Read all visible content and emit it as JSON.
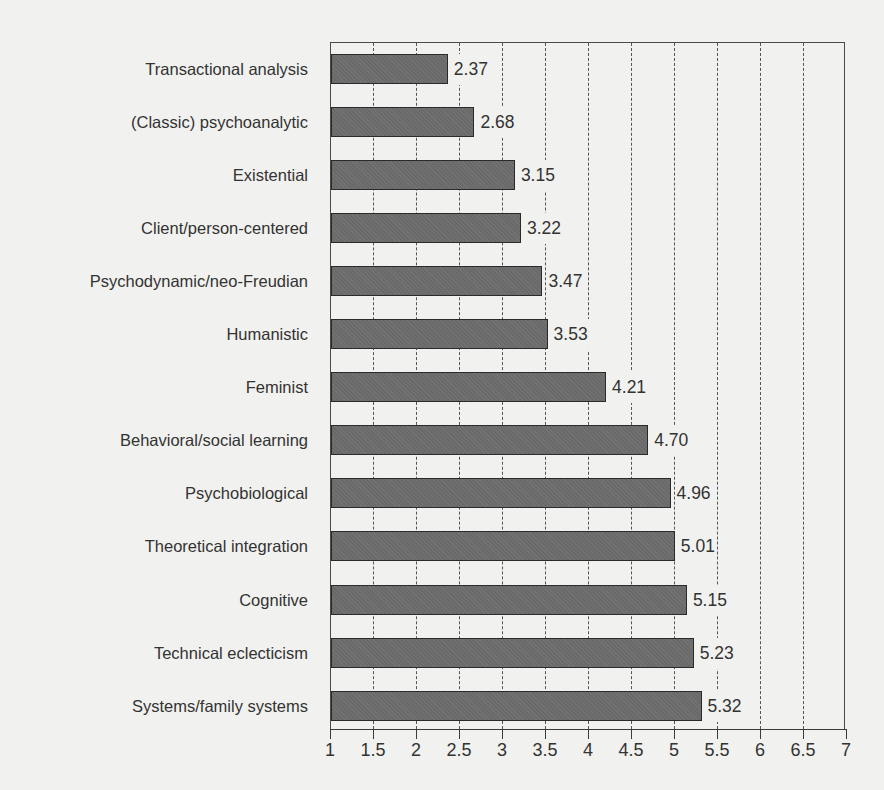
{
  "chart_data": {
    "type": "bar",
    "orientation": "horizontal",
    "title": "",
    "xlabel": "",
    "ylabel": "",
    "xlim": [
      1,
      7
    ],
    "x_ticks": [
      "1",
      "1.5",
      "2",
      "2.5",
      "3",
      "3.5",
      "4",
      "4.5",
      "5",
      "5.5",
      "6",
      "6.5",
      "7"
    ],
    "grid": "vertical dashed",
    "legend": "none",
    "bar_color": "#6a6a6a",
    "categories": [
      "Transactional analysis",
      "(Classic) psychoanalytic",
      "Existential",
      "Client/person-centered",
      "Psychodynamic/neo-Freudian",
      "Humanistic",
      "Feminist",
      "Behavioral/social learning",
      "Psychobiological",
      "Theoretical integration",
      "Cognitive",
      "Technical eclecticism",
      "Systems/family systems"
    ],
    "values": [
      2.37,
      2.68,
      3.15,
      3.22,
      3.47,
      3.53,
      4.21,
      4.7,
      4.96,
      5.01,
      5.15,
      5.23,
      5.32
    ],
    "value_labels": [
      "2.37",
      "2.68",
      "3.15",
      "3.22",
      "3.47",
      "3.53",
      "4.21",
      "4.70",
      "4.96",
      "5.01",
      "5.15",
      "5.23",
      "5.32"
    ]
  }
}
